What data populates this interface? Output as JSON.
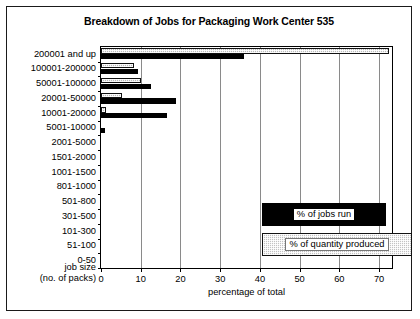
{
  "chart_data": {
    "type": "bar",
    "orientation": "horizontal",
    "title": "Breakdown of Jobs for Packaging Work Center 535",
    "xlabel": "percentage of total",
    "ylabel": "job size (no. of packs)",
    "ylabel_line1": "job size",
    "ylabel_line2": "(no. of packs)",
    "xlim": [
      0,
      73.25
    ],
    "xticks": [
      0,
      10,
      20,
      30,
      40,
      50,
      60,
      70
    ],
    "xticklabels": [
      "0",
      "10",
      "20",
      "30",
      "40",
      "50",
      "60",
      "70"
    ],
    "grid": "vertical",
    "legend_position": "center-right-inside",
    "categories": [
      "200001 and up",
      "100001-200000",
      "50001-100000",
      "20001-50000",
      "10001-20000",
      "5001-10000",
      "2001-5000",
      "1501-2000",
      "1001-1500",
      "801-1000",
      "501-800",
      "301-500",
      "101-300",
      "51-100",
      "0-50"
    ],
    "series": [
      {
        "name": "% of jobs run",
        "color": "#000000",
        "values": [
          36.0,
          9.2,
          12.7,
          19.0,
          16.5,
          1.0,
          0,
          0,
          0,
          0,
          0,
          0,
          0,
          0,
          0
        ]
      },
      {
        "name": "% of quantity produced",
        "color": "#c2c2c2",
        "values": [
          72.5,
          8.2,
          10.0,
          5.2,
          1.3,
          0,
          0,
          0,
          0,
          0,
          0,
          0,
          0,
          0,
          0
        ]
      }
    ]
  }
}
